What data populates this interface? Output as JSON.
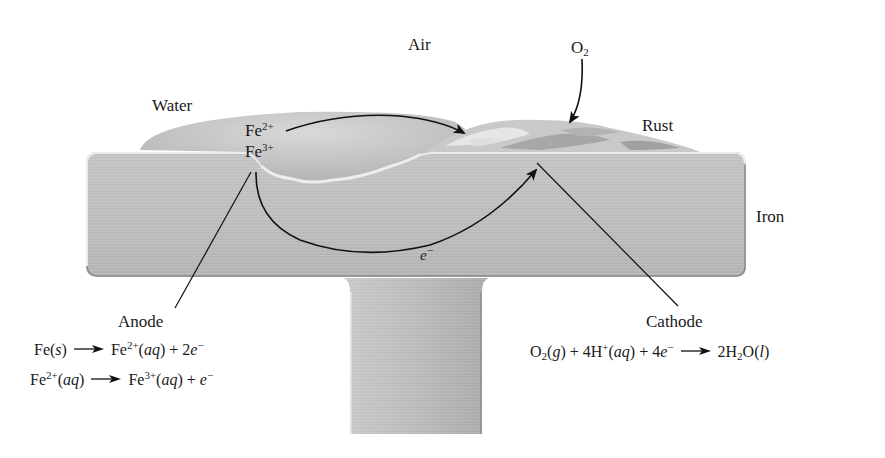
{
  "labels": {
    "air": "Air",
    "water": "Water",
    "o2": "O",
    "o2_sub": "2",
    "rust": "Rust",
    "iron": "Iron",
    "anode": "Anode",
    "cathode": "Cathode",
    "fe2": "Fe",
    "fe2_sup": "2+",
    "fe3": "Fe",
    "fe3_sup": "3+",
    "electron": "e",
    "electron_sup": "−"
  },
  "anode_equations": [
    {
      "lhs": [
        "Fe(",
        "s",
        ")"
      ],
      "rhs_species": "Fe",
      "rhs_sup": "2+",
      "rhs_state": "aq",
      "rhs_tail": " + 2",
      "rhs_e": "e",
      "rhs_e_sup": "−"
    },
    {
      "lhs_species": "Fe",
      "lhs_sup": "2+",
      "lhs_state": "aq",
      "rhs_species": "Fe",
      "rhs_sup": "3+",
      "rhs_state": "aq",
      "rhs_tail": " + ",
      "rhs_e": "e",
      "rhs_e_sup": "−"
    }
  ],
  "cathode_equation": {
    "o2": "O",
    "o2_sub": "2",
    "o2_state": "g",
    "plus1": " + 4H",
    "h_sup": "+",
    "h_state": "aq",
    "plus2": " + 4",
    "e": "e",
    "e_sup": "−",
    "product_coeff": "2H",
    "product_sub": "2",
    "product_o": "O",
    "product_state": "l"
  },
  "colors": {
    "iron": "#b9b9b9",
    "iron_edge": "#e6e6e6",
    "iron_shadow": "#8f8f8f",
    "water": "#c4c4c4",
    "rust_light": "#d6d6d6",
    "rust_dark": "#a3a3a3",
    "ink": "#1a1a1a"
  }
}
